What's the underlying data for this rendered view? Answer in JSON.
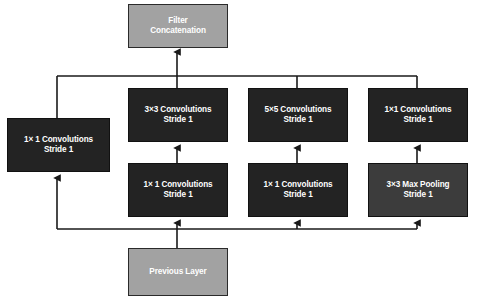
{
  "diagram": {
    "type": "flowchart",
    "colors": {
      "conv_box": "#232323",
      "pool_box": "#3c3c3c",
      "io_box": "#a2a2a2",
      "text": "#ffffff",
      "wire": "#1a1a1a",
      "background": "#ffffff"
    },
    "nodes": [
      {
        "id": "filter-concatenation",
        "line1": "Filter",
        "line2": "Concatenation",
        "style": "gray"
      },
      {
        "id": "left-1x1-conv",
        "line1": "1× 1 Convolutions",
        "line2": "Stride 1",
        "style": "dark"
      },
      {
        "id": "3x3-conv",
        "line1": "3×3 Convolutions",
        "line2": "Stride 1",
        "style": "dark"
      },
      {
        "id": "5x5-conv",
        "line1": "5×5 Convolutions",
        "line2": "Stride 1",
        "style": "dark"
      },
      {
        "id": "right-1x1-conv",
        "line1": "1×1 Convolutions",
        "line2": "Stride 1",
        "style": "dark"
      },
      {
        "id": "1x1-reduce-a",
        "line1": "1× 1 Convolutions",
        "line2": "Stride 1",
        "style": "dark"
      },
      {
        "id": "1x1-reduce-b",
        "line1": "1× 1 Convolutions",
        "line2": "Stride 1",
        "style": "dark"
      },
      {
        "id": "3x3-max-pooling",
        "line1": "3×3 Max Pooling",
        "line2": "Stride 1",
        "style": "pool"
      },
      {
        "id": "previous-layer",
        "line1": "Previous Layer",
        "line2": "",
        "style": "gray"
      }
    ],
    "edges": [
      {
        "from": "previous-layer",
        "to": "1x1-reduce-a"
      },
      {
        "from": "previous-layer",
        "to": "1x1-reduce-b"
      },
      {
        "from": "previous-layer",
        "to": "3x3-max-pooling"
      },
      {
        "from": "previous-layer",
        "to": "left-1x1-conv"
      },
      {
        "from": "1x1-reduce-a",
        "to": "3x3-conv"
      },
      {
        "from": "1x1-reduce-b",
        "to": "5x5-conv"
      },
      {
        "from": "3x3-max-pooling",
        "to": "right-1x1-conv"
      },
      {
        "from": "left-1x1-conv",
        "to": "filter-concatenation"
      },
      {
        "from": "3x3-conv",
        "to": "filter-concatenation"
      },
      {
        "from": "5x5-conv",
        "to": "filter-concatenation"
      },
      {
        "from": "right-1x1-conv",
        "to": "filter-concatenation"
      }
    ]
  }
}
